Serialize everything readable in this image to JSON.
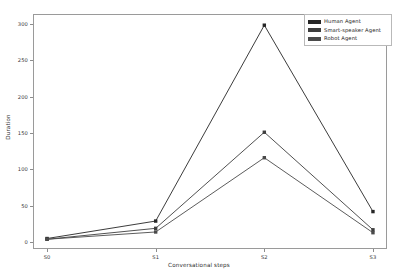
{
  "chart_data": {
    "type": "line",
    "title": "",
    "xlabel": "Conversational steps",
    "ylabel": "Duration",
    "categories": [
      "S0",
      "S1",
      "S2",
      "S3"
    ],
    "xlim": [
      -0.12,
      3.12
    ],
    "ylim": [
      -8,
      312
    ],
    "yticks": [
      0,
      50,
      100,
      150,
      200,
      250,
      300
    ],
    "ytick_labels": [
      "0",
      "50",
      "100",
      "150",
      "200",
      "250",
      "300"
    ],
    "grid": false,
    "legend_position": "upper right",
    "marker": "square",
    "series": [
      {
        "name": "Human Agent",
        "color": "#262626",
        "values": [
          5,
          29,
          298,
          42
        ]
      },
      {
        "name": "Smart-speaker Agent",
        "color": "#3d3d3d",
        "values": [
          4,
          19,
          151,
          17
        ]
      },
      {
        "name": "Robot Agent",
        "color": "#4a4a4a",
        "values": [
          4,
          14,
          116,
          13
        ]
      }
    ]
  },
  "legend": {
    "items": [
      {
        "label": "Human Agent",
        "swatch_color": "#262626"
      },
      {
        "label": "Smart-speaker Agent",
        "swatch_color": "#3d3d3d"
      },
      {
        "label": "Robot Agent",
        "swatch_color": "#4a4a4a"
      }
    ]
  },
  "axes": {
    "frame_color": "#9a9a9a",
    "tick_color": "#8c8c8c",
    "label_color": "#2e2e2e"
  }
}
